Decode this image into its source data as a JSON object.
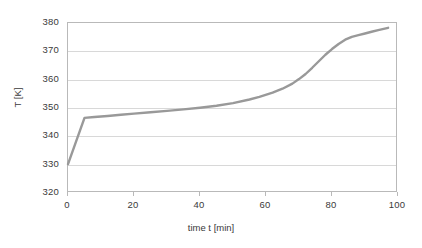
{
  "chart_data": {
    "type": "line",
    "title": "",
    "xlabel": "time t [min]",
    "ylabel": "T [K]",
    "xlim": [
      0,
      100
    ],
    "ylim": [
      320,
      380
    ],
    "xticks": [
      0,
      20,
      40,
      60,
      80,
      100
    ],
    "yticks": [
      320,
      330,
      340,
      350,
      360,
      370,
      380
    ],
    "xtick_labels": [
      "0",
      "20",
      "40",
      "60",
      "80",
      "100"
    ],
    "ytick_labels": [
      "320",
      "330",
      "340",
      "350",
      "360",
      "370",
      "380"
    ],
    "grid": "horizontal",
    "legend": "none",
    "series": [
      {
        "name": "T",
        "color": "#999999",
        "line_width": 2.4,
        "x": [
          0,
          5,
          8,
          12,
          16,
          20,
          25,
          30,
          35,
          40,
          45,
          50,
          55,
          58,
          62,
          65,
          68,
          70,
          72,
          74,
          76,
          78,
          80,
          82,
          84,
          86,
          88,
          90,
          92,
          94,
          97
        ],
        "y": [
          330.2,
          346.5,
          346.8,
          347.2,
          347.6,
          348.0,
          348.5,
          349.0,
          349.5,
          350.1,
          350.8,
          351.7,
          353.0,
          353.9,
          355.4,
          356.8,
          358.6,
          360.2,
          362.0,
          364.2,
          366.5,
          368.8,
          370.8,
          372.6,
          374.1,
          375.1,
          375.7,
          376.3,
          376.9,
          377.5,
          378.3
        ]
      }
    ]
  }
}
